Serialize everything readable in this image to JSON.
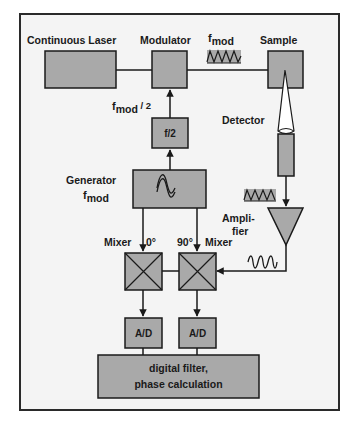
{
  "diagram": {
    "colors": {
      "frame_fill": "#f4f4f4",
      "frame_stroke": "#2a2a2a",
      "box_fill": "#a9a9a9",
      "line": "#1a1a1a",
      "detector_cone": "#ffffff"
    },
    "labels": {
      "continuous_laser": "Continuous Laser",
      "modulator": "Modulator",
      "sample": "Sample",
      "f_mod_prefix": "f",
      "f_mod_sub": "mod",
      "f_mod_half_prefix": "f",
      "f_mod_half_sub": "mod",
      "f_mod_half_suffix": " / 2",
      "divider": "f/2",
      "detector": "Detector",
      "generator": "Generator",
      "generator_f_prefix": "f",
      "generator_f_sub": "mod",
      "amplifier_line1": "Ampli-",
      "amplifier_line2": "fier",
      "mixer_left": "Mixer",
      "mixer_right": "Mixer",
      "phase_0": "0°",
      "phase_90": "90°",
      "ad_left": "A/D",
      "ad_right": "A/D",
      "filter_line1": "digital filter,",
      "filter_line2": "phase calculation"
    },
    "nodes": [
      {
        "id": "continuous-laser",
        "type": "box"
      },
      {
        "id": "modulator",
        "type": "box"
      },
      {
        "id": "sample",
        "type": "box"
      },
      {
        "id": "divider-f2",
        "type": "box"
      },
      {
        "id": "detector",
        "type": "detector"
      },
      {
        "id": "generator",
        "type": "box",
        "icon": "sine-wave-icon"
      },
      {
        "id": "amplifier",
        "type": "triangle"
      },
      {
        "id": "mixer-0",
        "type": "mixer"
      },
      {
        "id": "mixer-90",
        "type": "mixer"
      },
      {
        "id": "ad-left",
        "type": "box"
      },
      {
        "id": "ad-right",
        "type": "box"
      },
      {
        "id": "digital-filter",
        "type": "box"
      }
    ],
    "edges": [
      {
        "from": "continuous-laser",
        "to": "modulator"
      },
      {
        "from": "modulator",
        "to": "sample",
        "label": "f_mod",
        "signal": "square-wave"
      },
      {
        "from": "sample",
        "to": "detector"
      },
      {
        "from": "divider-f2",
        "to": "modulator",
        "label": "f_mod / 2"
      },
      {
        "from": "generator",
        "to": "divider-f2"
      },
      {
        "from": "generator",
        "to": "mixer-0"
      },
      {
        "from": "generator",
        "to": "mixer-90"
      },
      {
        "from": "detector",
        "to": "amplifier",
        "signal": "square-wave"
      },
      {
        "from": "amplifier",
        "to": "mixer-90",
        "signal": "sine-wave"
      },
      {
        "from": "mixer-90",
        "to": "mixer-0"
      },
      {
        "from": "mixer-0",
        "to": "ad-left"
      },
      {
        "from": "mixer-90",
        "to": "ad-right"
      },
      {
        "from": "ad-left",
        "to": "digital-filter"
      },
      {
        "from": "ad-right",
        "to": "digital-filter"
      }
    ]
  }
}
